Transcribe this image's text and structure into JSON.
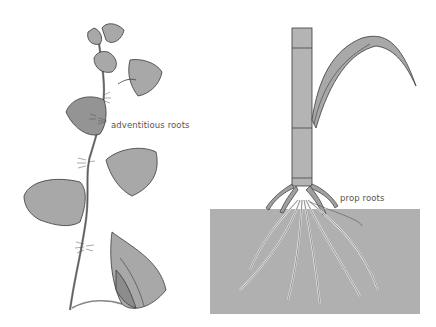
{
  "figure": {
    "left_panel": {
      "subject": "vine with heart-shaped leaves",
      "label": "adventitious roots"
    },
    "right_panel": {
      "subject": "corn stalk with leaf and roots in soil",
      "label": "prop roots"
    },
    "colors": {
      "leaf_fill": "#a8a8a8",
      "leaf_dark": "#8c8c8c",
      "outline": "#3a3a3a",
      "soil": "#b0b0b0",
      "stalk": "#b4b4b4",
      "root": "#e6e6e6"
    }
  }
}
